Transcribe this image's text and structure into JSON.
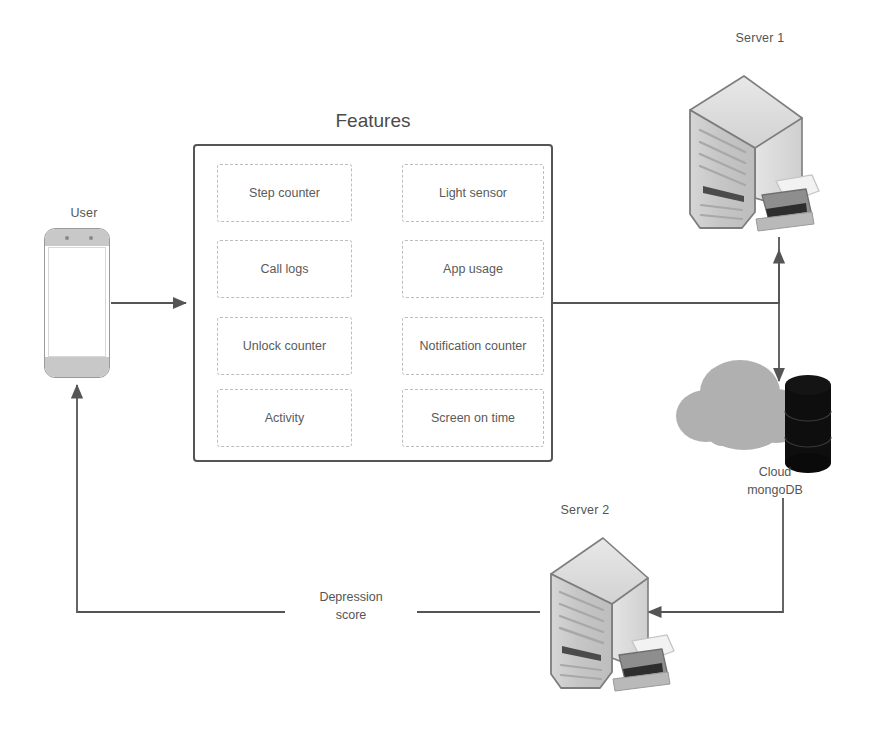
{
  "diagram": {
    "title_features": "Features",
    "nodes": {
      "user": {
        "label": "User",
        "icon": "smartphone-icon"
      },
      "server1": {
        "label": "Server 1",
        "icon": "server-tower-icon"
      },
      "server2": {
        "label": "Server 2",
        "icon": "server-tower-icon"
      },
      "cloud": {
        "label_line1": "Cloud",
        "label_line2": "mongoDB",
        "icon": "cloud-database-icon"
      }
    },
    "features": [
      {
        "label": "Step counter",
        "column": "left",
        "row": 1
      },
      {
        "label": "Light sensor",
        "column": "right",
        "row": 1
      },
      {
        "label": "Call logs",
        "column": "left",
        "row": 2
      },
      {
        "label": "App usage",
        "column": "right",
        "row": 2
      },
      {
        "label": "Unlock counter",
        "column": "left",
        "row": 3
      },
      {
        "label": "Notification counter",
        "column": "right",
        "row": 3
      },
      {
        "label": "Activity",
        "column": "left",
        "row": 4
      },
      {
        "label": "Screen on time",
        "column": "right",
        "row": 4
      }
    ],
    "edges": [
      {
        "from": "user",
        "to": "features",
        "label": ""
      },
      {
        "from": "features",
        "to": "server1",
        "label": ""
      },
      {
        "from": "server1",
        "to": "cloud",
        "label": ""
      },
      {
        "from": "cloud",
        "to": "server2",
        "label": ""
      },
      {
        "from": "server2",
        "to": "user",
        "label": "Depression score"
      }
    ],
    "edge_label_depression": "Depression score",
    "colors": {
      "line": "#555555",
      "box_border": "#555555",
      "cell_border": "#bdbdbd",
      "text": "#555555",
      "server_body": "#c9c9c9",
      "server_side": "#dcdcdc",
      "cloud": "#b0b0b0",
      "database": "#111111",
      "phone_bezel": "#c8c8c8"
    }
  }
}
